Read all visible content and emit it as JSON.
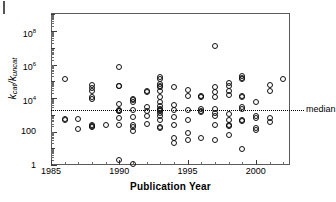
{
  "figure": {
    "panel_label": "",
    "xaxis_title": "Publication Year",
    "yaxis_label_main": "k",
    "yaxis_label_sub1": "cat",
    "yaxis_label_mid": "/k",
    "yaxis_label_sub2": "uncat",
    "median_label": "median",
    "marker": "open-circle",
    "frame_color": "#5a5a5a"
  },
  "chart_data": {
    "type": "scatter",
    "title": "",
    "xlabel": "Publication Year",
    "ylabel": "k_cat/k_uncat",
    "xlim": [
      1985,
      2002.5
    ],
    "ylim": [
      1,
      1200000000.0
    ],
    "yscale": "log",
    "xscale": "linear",
    "grid": false,
    "legend": null,
    "xticks": [
      1985,
      1990,
      1995,
      2000
    ],
    "xtick_labels": [
      "1985",
      "1990",
      "1995",
      "2000"
    ],
    "yticks": [
      1,
      100,
      10000,
      1000000,
      100000000
    ],
    "ytick_labels": [
      "1",
      "100",
      "10<sup>4</sup>",
      "10<sup>6</sup>",
      "10<sup>8</sup>"
    ],
    "annotations": [
      {
        "text": "median",
        "y": 2000,
        "type": "hline-label",
        "position": "right"
      }
    ],
    "median_value": 2000,
    "points": [
      {
        "x": 1986,
        "y": 130000.0
      },
      {
        "x": 1986,
        "y": 550
      },
      {
        "x": 1986,
        "y": 500
      },
      {
        "x": 1987,
        "y": 550
      },
      {
        "x": 1987,
        "y": 150
      },
      {
        "x": 1988,
        "y": 60000.0
      },
      {
        "x": 1988,
        "y": 40000.0
      },
      {
        "x": 1988,
        "y": 26000.0
      },
      {
        "x": 1988,
        "y": 12000.0
      },
      {
        "x": 1988,
        "y": 9000.0
      },
      {
        "x": 1988,
        "y": 260
      },
      {
        "x": 1988,
        "y": 220
      },
      {
        "x": 1988,
        "y": 190
      },
      {
        "x": 1989,
        "y": 240
      },
      {
        "x": 1990,
        "y": 700000.0
      },
      {
        "x": 1990,
        "y": 55000.0
      },
      {
        "x": 1990,
        "y": 50000.0
      },
      {
        "x": 1990,
        "y": 4500.0
      },
      {
        "x": 1990,
        "y": 2000.0
      },
      {
        "x": 1990,
        "y": 1800.0
      },
      {
        "x": 1990,
        "y": 1600.0
      },
      {
        "x": 1990,
        "y": 600
      },
      {
        "x": 1990,
        "y": 250
      },
      {
        "x": 1990,
        "y": 2.0
      },
      {
        "x": 1991,
        "y": 9000.0
      },
      {
        "x": 1991,
        "y": 7500.0
      },
      {
        "x": 1991,
        "y": 6000.0
      },
      {
        "x": 1991,
        "y": 2000.0
      },
      {
        "x": 1991,
        "y": 700
      },
      {
        "x": 1991,
        "y": 260
      },
      {
        "x": 1991,
        "y": 180
      },
      {
        "x": 1991,
        "y": 110
      },
      {
        "x": 1991,
        "y": 1.1
      },
      {
        "x": 1992,
        "y": 26000.0
      },
      {
        "x": 1992,
        "y": 22000.0
      },
      {
        "x": 1992,
        "y": 3000.0
      },
      {
        "x": 1992,
        "y": 1600.0
      },
      {
        "x": 1992,
        "y": 900
      },
      {
        "x": 1992,
        "y": 280
      },
      {
        "x": 1993,
        "y": 190000.0
      },
      {
        "x": 1993,
        "y": 130000.0
      },
      {
        "x": 1993,
        "y": 70000.0
      },
      {
        "x": 1993,
        "y": 55000.0
      },
      {
        "x": 1993,
        "y": 45000.0
      },
      {
        "x": 1993,
        "y": 26000.0
      },
      {
        "x": 1993,
        "y": 12000.0
      },
      {
        "x": 1993,
        "y": 6000.0
      },
      {
        "x": 1993,
        "y": 3500.0
      },
      {
        "x": 1993,
        "y": 2300.0
      },
      {
        "x": 1993,
        "y": 2000.0
      },
      {
        "x": 1993,
        "y": 1700.0
      },
      {
        "x": 1993,
        "y": 1200.0
      },
      {
        "x": 1993,
        "y": 800
      },
      {
        "x": 1993,
        "y": 520
      },
      {
        "x": 1993,
        "y": 190
      },
      {
        "x": 1993,
        "y": 160
      },
      {
        "x": 1994,
        "y": 45000.0
      },
      {
        "x": 1994,
        "y": 4000.0
      },
      {
        "x": 1994,
        "y": 2000.0
      },
      {
        "x": 1994,
        "y": 700
      },
      {
        "x": 1994,
        "y": 230
      },
      {
        "x": 1994,
        "y": 40
      },
      {
        "x": 1994,
        "y": 22
      },
      {
        "x": 1995,
        "y": 30000.0
      },
      {
        "x": 1995,
        "y": 14000.0
      },
      {
        "x": 1995,
        "y": 2000.0
      },
      {
        "x": 1995,
        "y": 500
      },
      {
        "x": 1995,
        "y": 80
      },
      {
        "x": 1995,
        "y": 30
      },
      {
        "x": 1996,
        "y": 13000.0
      },
      {
        "x": 1996,
        "y": 12000.0
      },
      {
        "x": 1996,
        "y": 2200.0
      },
      {
        "x": 1996,
        "y": 1800.0
      },
      {
        "x": 1996,
        "y": 1400.0
      },
      {
        "x": 1996,
        "y": 40
      },
      {
        "x": 1997,
        "y": 12000000.0
      },
      {
        "x": 1997,
        "y": 45000.0
      },
      {
        "x": 1997,
        "y": 22000.0
      },
      {
        "x": 1997,
        "y": 11000.0
      },
      {
        "x": 1997,
        "y": 2200.0
      },
      {
        "x": 1997,
        "y": 1300.0
      },
      {
        "x": 1997,
        "y": 800
      },
      {
        "x": 1997,
        "y": 260
      },
      {
        "x": 1997,
        "y": 30
      },
      {
        "x": 1998,
        "y": 80000.0
      },
      {
        "x": 1998,
        "y": 55000.0
      },
      {
        "x": 1998,
        "y": 26000.0
      },
      {
        "x": 1998,
        "y": 16000.0
      },
      {
        "x": 1998,
        "y": 1100.0
      },
      {
        "x": 1998,
        "y": 500
      },
      {
        "x": 1998,
        "y": 250
      },
      {
        "x": 1998,
        "y": 200
      },
      {
        "x": 1998,
        "y": 60
      },
      {
        "x": 1999,
        "y": 220000.0
      },
      {
        "x": 1999,
        "y": 160000.0
      },
      {
        "x": 1999,
        "y": 130000.0
      },
      {
        "x": 1999,
        "y": 13000.0
      },
      {
        "x": 1999,
        "y": 11000.0
      },
      {
        "x": 1999,
        "y": 3000.0
      },
      {
        "x": 1999,
        "y": 2200.0
      },
      {
        "x": 1999,
        "y": 500
      },
      {
        "x": 1999,
        "y": 420
      },
      {
        "x": 1999,
        "y": 9.0
      },
      {
        "x": 2000,
        "y": 5500.0
      },
      {
        "x": 2000,
        "y": 900
      },
      {
        "x": 2000,
        "y": 600
      },
      {
        "x": 2000,
        "y": 160
      },
      {
        "x": 2000,
        "y": 130
      },
      {
        "x": 2001,
        "y": 60000.0
      },
      {
        "x": 2001,
        "y": 26000.0
      },
      {
        "x": 2001,
        "y": 600
      },
      {
        "x": 2001,
        "y": 350
      },
      {
        "x": 2002,
        "y": 130000.0
      }
    ],
    "bold_points": [
      {
        "x": 1990,
        "y": 55000.0
      },
      {
        "x": 1996,
        "y": 13000.0
      },
      {
        "x": 1996,
        "y": 12000.0
      },
      {
        "x": 1993,
        "y": 2300.0
      },
      {
        "x": 1998,
        "y": 200
      },
      {
        "x": 1999,
        "y": 420
      },
      {
        "x": 1988,
        "y": 9000.0
      },
      {
        "x": 1988,
        "y": 190
      }
    ]
  }
}
